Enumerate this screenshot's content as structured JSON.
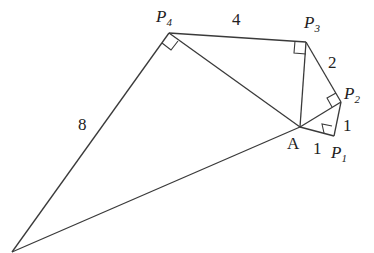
{
  "diagram": {
    "type": "geometry-spiral-right-triangles",
    "points": {
      "A": {
        "label": "A",
        "x": 300,
        "y": 127
      },
      "P1": {
        "label": "P",
        "sub": "1",
        "x": 334,
        "y": 136
      },
      "P2": {
        "label": "P",
        "sub": "2",
        "x": 341,
        "y": 102
      },
      "P3": {
        "label": "P",
        "sub": "3",
        "x": 306,
        "y": 42
      },
      "P4": {
        "label": "P",
        "sub": "4",
        "x": 169,
        "y": 33
      },
      "P5": {
        "x": 12,
        "y": 252
      }
    },
    "edge_labels": {
      "AP1": "1",
      "P1P2": "1",
      "P2P3": "2",
      "P3P4": "4",
      "P4P5": "8"
    },
    "label_A": "A",
    "label_P": "P",
    "sub_1": "1",
    "sub_2": "2",
    "sub_3": "3",
    "sub_4": "4"
  }
}
